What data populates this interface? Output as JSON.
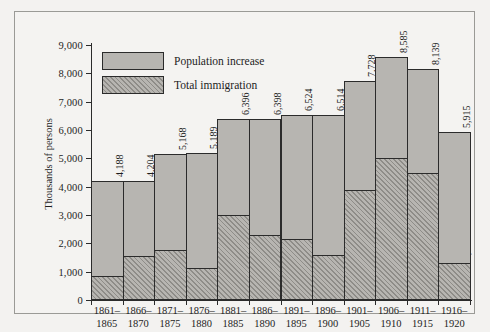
{
  "chart_data": {
    "type": "bar",
    "title": "",
    "subtitle": "",
    "xlabel": "",
    "ylabel": "Thousands of persons",
    "ylim": [
      0,
      9000
    ],
    "ytick_values": [
      0,
      1000,
      2000,
      3000,
      4000,
      5000,
      6000,
      7000,
      8000,
      9000
    ],
    "ytick_labels": [
      "0",
      "1,000",
      "2,000",
      "3,000",
      "4,000",
      "5,000",
      "6,000",
      "7,000",
      "8,000",
      "9,000"
    ],
    "grid": false,
    "legend_position": "inside top-left",
    "categories": [
      "1861-1865",
      "1866-1870",
      "1871-1875",
      "1876-1880",
      "1881-1885",
      "1886-1890",
      "1891-1895",
      "1896-1900",
      "1901-1905",
      "1906-1910",
      "1911-1915",
      "1916-1920"
    ],
    "category_lines": [
      [
        "1861–",
        "1865"
      ],
      [
        "1866–",
        "1870"
      ],
      [
        "1871–",
        "1875"
      ],
      [
        "1876–",
        "1880"
      ],
      [
        "1881–",
        "1885"
      ],
      [
        "1886–",
        "1890"
      ],
      [
        "1891–",
        "1895"
      ],
      [
        "1896–",
        "1900"
      ],
      [
        "1901–",
        "1905"
      ],
      [
        "1906–",
        "1910"
      ],
      [
        "1911–",
        "1915"
      ],
      [
        "1916–",
        "1920"
      ]
    ],
    "series": [
      {
        "name": "Population increase",
        "style": "solid-gray",
        "values": [
          4188,
          4204,
          5168,
          5189,
          6396,
          6398,
          6524,
          6514,
          7728,
          8585,
          8139,
          5915
        ],
        "labels": [
          "4,188",
          "4,204",
          "5,168",
          "5,189",
          "6,396",
          "6,398",
          "6,524",
          "6,514",
          "7,728",
          "8,585",
          "8,139",
          "5,915"
        ]
      },
      {
        "name": "Total immigration",
        "style": "hatched",
        "values": [
          802,
          1513,
          1727,
          1086,
          2976,
          2271,
          2124,
          1564,
          3833,
          4962,
          4460,
          1276
        ],
        "labels": [
          "802",
          "1,513",
          "1,727",
          "1,086",
          "2,976",
          "2,271",
          "2,124",
          "1,564",
          "3,833",
          "4,962",
          "4,460",
          "1,276"
        ]
      }
    ],
    "colors": {
      "bar_fill": "#b7b5b1",
      "hatch_stroke": "#8e8c88",
      "outline": "#2b2b2b",
      "background": "#f3f2f0",
      "text": "#1d1d1d"
    }
  },
  "legend": {
    "items": [
      {
        "label": "Population increase",
        "style": "solid-gray"
      },
      {
        "label": "Total immigration",
        "style": "hatched"
      }
    ]
  }
}
